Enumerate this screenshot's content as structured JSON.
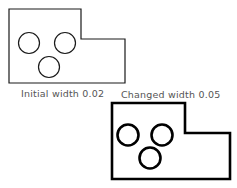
{
  "figures": [
    {
      "label": "Initial width 0.02",
      "stroke_color": "#1a1a1a",
      "stroke_width": 1.2,
      "outline": "9,9 81,9 81,39 125,39 125,83 9,83",
      "circles": [
        {
          "cx": 29,
          "cy": 43,
          "r": 10.5
        },
        {
          "cx": 65,
          "cy": 43,
          "r": 10.5
        },
        {
          "cx": 49,
          "cy": 67,
          "r": 10.5
        }
      ]
    },
    {
      "label": "Changed width 0.05",
      "stroke_color": "#000000",
      "stroke_width": 2.6,
      "outline": "112,103 185,103 185,133 230,133 230,179 112,179",
      "circles": [
        {
          "cx": 128,
          "cy": 135,
          "r": 10.5
        },
        {
          "cx": 162,
          "cy": 135,
          "r": 10.5
        },
        {
          "cx": 150,
          "cy": 158,
          "r": 10.5
        }
      ]
    }
  ]
}
